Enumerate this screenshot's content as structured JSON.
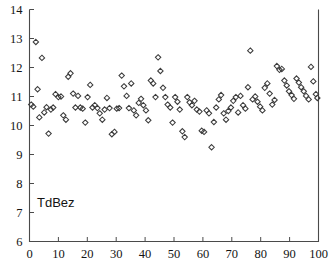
{
  "chart_data": {
    "type": "scatter",
    "title": "",
    "subtitle": "",
    "xlabel": "",
    "ylabel": "",
    "series_label": "TdBez",
    "annotations": [
      "TdBez"
    ],
    "legend_position": "none",
    "grid": false,
    "marker": "diamond-open",
    "marker_color": "#3c3c3c",
    "xlim": [
      0,
      100
    ],
    "ylim": [
      6,
      14
    ],
    "xticks": [
      0,
      10,
      20,
      30,
      40,
      50,
      60,
      70,
      80,
      90,
      100
    ],
    "yticks": [
      6,
      7,
      8,
      9,
      10,
      11,
      12,
      13,
      14
    ],
    "xticklabels": [
      "0",
      "10",
      "20",
      "30",
      "40",
      "50",
      "60",
      "70",
      "80",
      "90",
      "100"
    ],
    "yticklabels": [
      "6",
      "7",
      "8",
      "9",
      "10",
      "11",
      "12",
      "13",
      "14"
    ],
    "x": [
      0.6,
      1.3,
      2.2,
      2.8,
      3.4,
      4.3,
      5.1,
      5.9,
      6.6,
      7.4,
      8.2,
      9.0,
      10.0,
      10.9,
      11.7,
      12.6,
      13.4,
      14.2,
      15.1,
      15.9,
      16.8,
      17.6,
      18.4,
      19.3,
      20.1,
      21.0,
      21.8,
      22.6,
      23.5,
      24.3,
      25.2,
      26.0,
      26.8,
      27.7,
      28.5,
      29.4,
      30.2,
      31.0,
      31.9,
      32.7,
      33.6,
      34.4,
      35.2,
      36.1,
      36.9,
      37.8,
      38.6,
      39.4,
      40.3,
      41.1,
      42.0,
      42.8,
      43.6,
      44.5,
      45.3,
      46.2,
      47.0,
      47.8,
      48.7,
      49.5,
      50.4,
      51.2,
      52.0,
      52.9,
      53.7,
      54.6,
      55.4,
      56.2,
      57.1,
      57.9,
      58.8,
      59.6,
      60.4,
      61.3,
      62.1,
      63.0,
      63.8,
      64.6,
      65.5,
      66.3,
      67.2,
      68.0,
      68.8,
      69.7,
      70.5,
      71.4,
      72.2,
      73.0,
      73.9,
      74.7,
      75.6,
      76.4,
      77.2,
      78.1,
      78.9,
      79.8,
      80.6,
      81.4,
      82.3,
      83.1,
      84.0,
      84.8,
      85.6,
      86.5,
      87.3,
      88.2,
      89.0,
      89.8,
      90.7,
      91.5,
      92.4,
      93.2,
      94.0,
      94.9,
      95.7,
      96.6,
      97.4,
      98.2,
      99.1,
      99.6
    ],
    "y": [
      10.72,
      10.65,
      12.88,
      11.25,
      10.28,
      12.33,
      10.45,
      10.63,
      9.72,
      10.55,
      10.62,
      11.08,
      10.98,
      11.0,
      10.35,
      10.2,
      11.68,
      11.8,
      11.1,
      10.62,
      11.02,
      10.62,
      10.58,
      10.1,
      10.98,
      11.4,
      10.62,
      10.7,
      10.6,
      10.42,
      10.2,
      10.55,
      10.95,
      10.6,
      9.7,
      9.78,
      10.58,
      10.6,
      11.72,
      11.35,
      11.02,
      10.6,
      11.45,
      10.52,
      10.35,
      10.78,
      10.92,
      10.7,
      10.52,
      10.18,
      11.55,
      11.45,
      10.98,
      12.35,
      11.88,
      11.3,
      10.98,
      10.72,
      10.62,
      10.1,
      10.98,
      10.82,
      10.55,
      9.8,
      9.6,
      10.98,
      10.8,
      10.7,
      10.85,
      10.55,
      10.48,
      9.82,
      9.78,
      10.52,
      10.42,
      9.25,
      10.12,
      10.62,
      10.9,
      11.05,
      10.42,
      10.2,
      10.5,
      10.62,
      10.85,
      10.98,
      10.45,
      11.02,
      10.7,
      10.58,
      11.32,
      12.58,
      10.9,
      11.0,
      10.82,
      10.65,
      10.52,
      11.3,
      11.45,
      11.1,
      10.72,
      10.88,
      12.05,
      11.92,
      11.95,
      11.55,
      11.38,
      11.18,
      11.05,
      10.92,
      11.62,
      11.48,
      11.32,
      11.18,
      11.02,
      10.9,
      12.02,
      11.52,
      11.08,
      10.95
    ]
  }
}
